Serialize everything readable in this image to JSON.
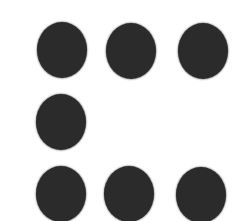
{
  "figure": {
    "dot_color": "#2b2b2b",
    "background": "#ffffff",
    "grid": [
      [
        1,
        1,
        1
      ],
      [
        1,
        0,
        0
      ],
      [
        1,
        1,
        1
      ]
    ],
    "dot_count": 7
  }
}
